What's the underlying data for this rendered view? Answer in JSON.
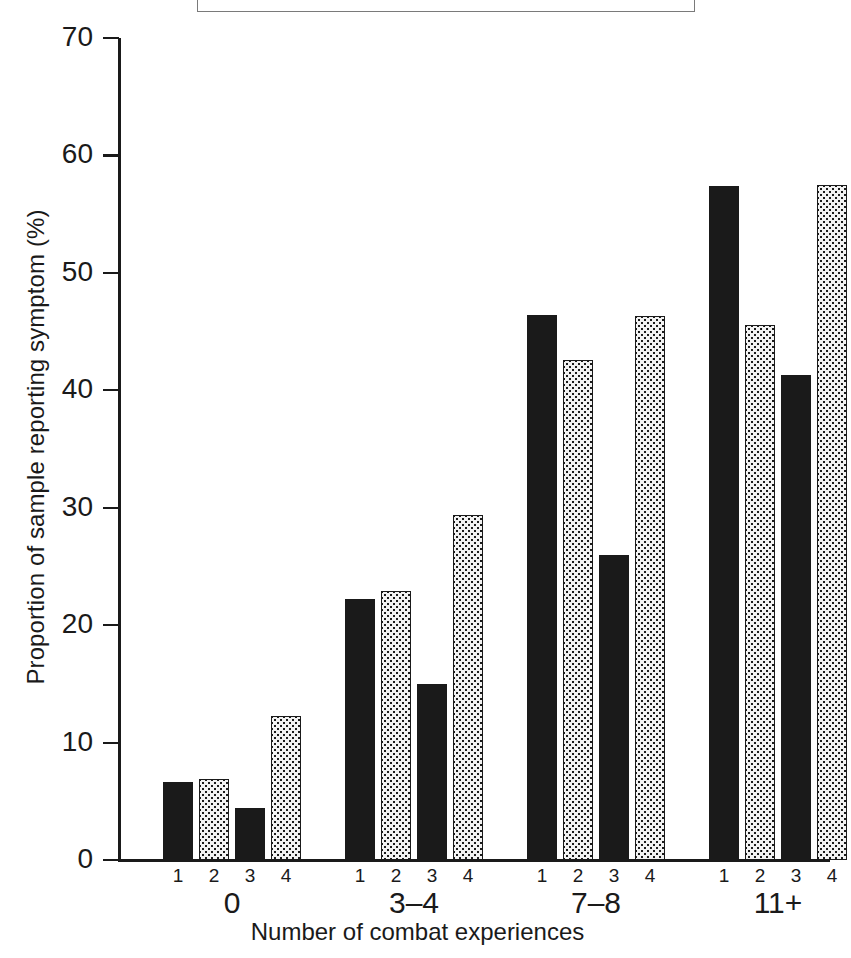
{
  "figure": {
    "caption_box": {
      "present": true,
      "note": "empty bordered box cropped at top edge of image"
    }
  },
  "chart_data": {
    "type": "bar",
    "title": "",
    "xlabel": "Number of combat experiences",
    "ylabel": "Proportion of sample reporting symptom (%)",
    "ylim": [
      0,
      70
    ],
    "yticks": [
      "0",
      "10",
      "20",
      "30",
      "40",
      "50",
      "60",
      "70"
    ],
    "grid": false,
    "legend": "none",
    "categories": [
      "0",
      "3–4",
      "7–8",
      "11+"
    ],
    "sub_labels": [
      "1",
      "2",
      "3",
      "4"
    ],
    "series": [
      {
        "name": "1",
        "fill": "solid-black",
        "values": [
          6.6,
          22.2,
          46.4,
          57.4
        ]
      },
      {
        "name": "2",
        "fill": "stippled",
        "values": [
          6.9,
          22.9,
          42.6,
          45.6
        ]
      },
      {
        "name": "3",
        "fill": "solid-black",
        "values": [
          4.4,
          15.0,
          26.0,
          41.3
        ]
      },
      {
        "name": "4",
        "fill": "stippled",
        "values": [
          12.3,
          29.4,
          46.3,
          57.5
        ]
      }
    ],
    "colors": {
      "solid": "#1a1a1a",
      "stipple_fill": "#f2f2f2",
      "stipple_dot": "#1a1a1a",
      "axis": "#1a1a1a",
      "background": "#ffffff"
    }
  }
}
